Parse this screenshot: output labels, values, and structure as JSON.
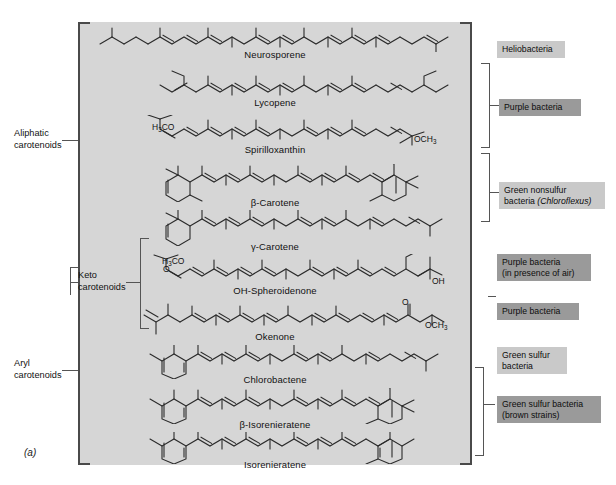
{
  "figure": {
    "letter": "(a)",
    "panel_background": "#d6d6d6",
    "badge_light_color": "#c9c9c9",
    "badge_dark_color": "#9a9a9a"
  },
  "categories": [
    {
      "id": "aliphatic",
      "label": "Aliphatic\ncarotenoids"
    },
    {
      "id": "keto",
      "label": "Keto\ncarotenoids"
    },
    {
      "id": "aryl",
      "label": "Aryl\ncarotenoids"
    }
  ],
  "compounds": [
    {
      "id": "neurosporene",
      "name": "Neurosporene"
    },
    {
      "id": "lycopene",
      "name": "Lycopene"
    },
    {
      "id": "spirilloxanthin",
      "name": "Spirilloxanthin"
    },
    {
      "id": "beta-carotene",
      "name": "β-Carotene"
    },
    {
      "id": "gamma-carotene",
      "name": "γ-Carotene"
    },
    {
      "id": "oh-spheroidenone",
      "name": "OH-Spheroidenone"
    },
    {
      "id": "okenone",
      "name": "Okenone"
    },
    {
      "id": "chlorobactene",
      "name": "Chlorobactene"
    },
    {
      "id": "beta-isorenieratene",
      "name": "β-Isorenieratene"
    },
    {
      "id": "isorenieratene",
      "name": "Isorenieratene"
    }
  ],
  "chem_groups": [
    {
      "id": "spirilloxanthin-left",
      "text": "H3CO"
    },
    {
      "id": "spirilloxanthin-right",
      "text": "OCH3"
    },
    {
      "id": "spheroidenone-left",
      "text": "H3CO"
    },
    {
      "id": "spheroidenone-left-oxo",
      "text": "O"
    },
    {
      "id": "spheroidenone-right-oh",
      "text": "OH"
    },
    {
      "id": "okenone-oxo",
      "text": "O"
    },
    {
      "id": "okenone-right",
      "text": "OCH3"
    }
  ],
  "organisms": [
    {
      "id": "heliobacteria",
      "label": "Heliobacteria",
      "tone": "light"
    },
    {
      "id": "purple-bacteria-1",
      "label": "Purple bacteria",
      "tone": "dark"
    },
    {
      "id": "green-nonsulfur",
      "label": "Green nonsulfur\nbacteria (Chloroflexus)",
      "tone": "light"
    },
    {
      "id": "purple-bacteria-air",
      "label": "Purple bacteria\n(in presence of air)",
      "tone": "dark"
    },
    {
      "id": "purple-bacteria-2",
      "label": "Purple bacteria",
      "tone": "dark"
    },
    {
      "id": "green-sulfur",
      "label": "Green sulfur\nbacteria",
      "tone": "light"
    },
    {
      "id": "green-sulfur-brown",
      "label": "Green sulfur bacteria\n(brown strains)",
      "tone": "dark"
    }
  ]
}
